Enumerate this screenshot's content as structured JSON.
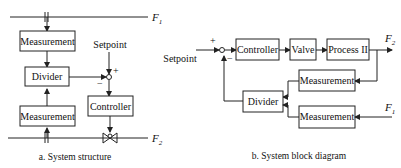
{
  "diagram_a": {
    "caption": "a. System structure",
    "flow_top": {
      "label": "F",
      "subscript": "1"
    },
    "flow_bottom": {
      "label": "F",
      "subscript": "2"
    },
    "measurement_top": "Measurement",
    "divider": "Divider",
    "measurement_bottom": "Measurement",
    "setpoint": "Setpoint",
    "plus": "+",
    "minus": "−",
    "controller": "Controller"
  },
  "diagram_b": {
    "caption": "b. System block diagram",
    "setpoint": "Setpoint",
    "plus": "+",
    "minus": "−",
    "controller": "Controller",
    "valve": "Valve",
    "process": "Process II",
    "output": {
      "label": "F",
      "subscript": "2"
    },
    "input": {
      "label": "F",
      "subscript": "1"
    },
    "measurement_top": "Measurement",
    "measurement_bottom": "Measurement",
    "divider": "Divider"
  }
}
